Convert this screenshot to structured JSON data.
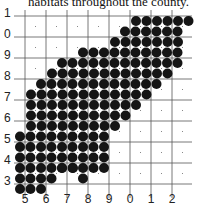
{
  "caption": "habitats throughout the county.",
  "map": {
    "type": "dot-distribution grid map",
    "y_labels": [
      "1",
      "0",
      "9",
      "8",
      "7",
      "6",
      "5",
      "4",
      "3"
    ],
    "x_labels": [
      "5",
      "6",
      "7",
      "8",
      "9",
      "0",
      "1",
      "2"
    ],
    "colors": {
      "dot": "#151515",
      "grid": "#555555",
      "background": "#ffffff"
    },
    "grid": {
      "x_lines": [
        25,
        46,
        67,
        88,
        109,
        130,
        151,
        172
      ],
      "y_lines": [
        16,
        37,
        58,
        79,
        100,
        121,
        142,
        163,
        184
      ],
      "x_min": 14,
      "x_max": 192
    },
    "dot_step": 10.5,
    "dot_radius": 5,
    "dot_rows": [
      {
        "y": 21,
        "x_start": 136,
        "count": 6
      },
      {
        "y": 31.5,
        "x_start": 125,
        "count": 6
      },
      {
        "y": 42,
        "x_start": 115,
        "count": 7
      },
      {
        "y": 52.5,
        "x_start": 83,
        "count": 10
      },
      {
        "y": 63,
        "x_start": 62,
        "count": 12
      },
      {
        "y": 73.5,
        "x_start": 52,
        "count": 12
      },
      {
        "y": 84,
        "x_start": 41,
        "count": 12
      },
      {
        "y": 94.5,
        "x_start": 31,
        "count": 12
      },
      {
        "y": 105,
        "x_start": 31,
        "count": 11
      },
      {
        "y": 115.5,
        "x_start": 31,
        "count": 10
      },
      {
        "y": 126,
        "x_start": 31,
        "count": 9
      },
      {
        "y": 136.5,
        "x_start": 20,
        "count": 9
      },
      {
        "y": 147,
        "x_start": 20,
        "count": 9
      },
      {
        "y": 157.5,
        "x_start": 20,
        "count": 9
      },
      {
        "y": 168,
        "x_start": 20,
        "count": 9
      },
      {
        "y": 178.5,
        "x_start": 20,
        "count": 4
      },
      {
        "y": 189,
        "x_start": 20,
        "count": 3
      }
    ],
    "extra_dots": [
      {
        "x": 83,
        "y": 178.5
      },
      {
        "x": 62,
        "y": 168
      },
      {
        "x": 73,
        "y": 168
      }
    ]
  }
}
